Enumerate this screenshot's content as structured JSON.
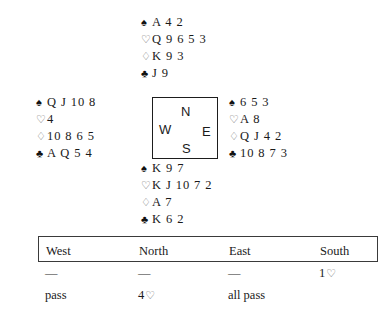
{
  "deal": {
    "hands": [
      {
        "position": "north",
        "label": "North hand",
        "suits": [
          {
            "symbol": "♠",
            "name": "spade-symbol",
            "color": "black",
            "cards": "A 4 2"
          },
          {
            "symbol": "♡",
            "name": "heart-symbol",
            "color": "white",
            "cards": "Q 9 6 5 3"
          },
          {
            "symbol": "♢",
            "name": "diamond-symbol",
            "color": "white",
            "cards": "K 9 3"
          },
          {
            "symbol": "♣",
            "name": "club-symbol",
            "color": "black",
            "cards": "J 9"
          }
        ]
      },
      {
        "position": "west",
        "label": "West hand",
        "suits": [
          {
            "symbol": "♠",
            "name": "spade-symbol",
            "color": "black",
            "cards": "Q J 10 8"
          },
          {
            "symbol": "♡",
            "name": "heart-symbol",
            "color": "white",
            "cards": "4"
          },
          {
            "symbol": "♢",
            "name": "diamond-symbol",
            "color": "white",
            "cards": "10 8 6 5"
          },
          {
            "symbol": "♣",
            "name": "club-symbol",
            "color": "black",
            "cards": "A Q 5 4"
          }
        ]
      },
      {
        "position": "east",
        "label": "East hand",
        "suits": [
          {
            "symbol": "♠",
            "name": "spade-symbol",
            "color": "black",
            "cards": "6 5 3"
          },
          {
            "symbol": "♡",
            "name": "heart-symbol",
            "color": "white",
            "cards": "A 8"
          },
          {
            "symbol": "♢",
            "name": "diamond-symbol",
            "color": "white",
            "cards": "Q J 4 2"
          },
          {
            "symbol": "♣",
            "name": "club-symbol",
            "color": "black",
            "cards": "10 8 7 3"
          }
        ]
      },
      {
        "position": "south",
        "label": "South hand",
        "suits": [
          {
            "symbol": "♠",
            "name": "spade-symbol",
            "color": "black",
            "cards": "K 9 7"
          },
          {
            "symbol": "♡",
            "name": "heart-symbol",
            "color": "white",
            "cards": "K J 10 7 2"
          },
          {
            "symbol": "♢",
            "name": "diamond-symbol",
            "color": "white",
            "cards": "A 7"
          },
          {
            "symbol": "♣",
            "name": "club-symbol",
            "color": "black",
            "cards": "K 6 2"
          }
        ]
      }
    ],
    "compass": {
      "north": "N",
      "west": "W",
      "east": "E",
      "south": "S"
    }
  },
  "auction": {
    "headers": {
      "west": "West",
      "north": "North",
      "east": "East",
      "south": "South"
    },
    "rows": [
      {
        "west": "—",
        "north": "—",
        "east": "—",
        "south": "1",
        "south_suit": "♡"
      },
      {
        "west": "pass",
        "north": "4",
        "north_suit": "♡",
        "east": "all pass",
        "south": ""
      }
    ]
  },
  "colors": {
    "ink": "#1a1a1a",
    "hollow_suit": "#6b6b6b",
    "rule": "#3a3a3a",
    "background": "#ffffff"
  }
}
